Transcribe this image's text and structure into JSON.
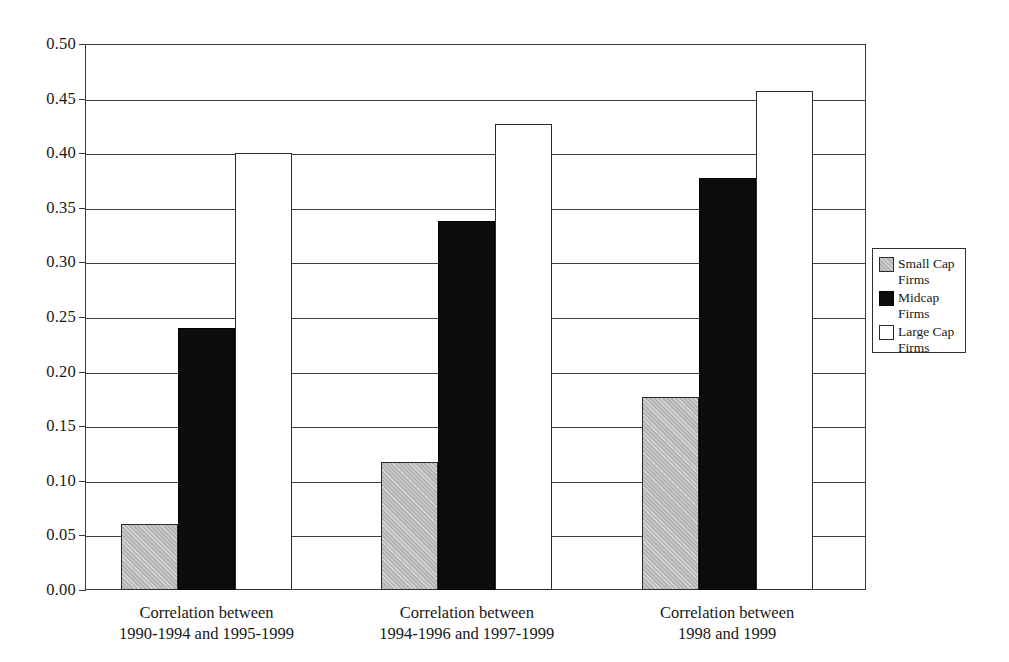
{
  "chart_data": {
    "type": "bar",
    "title": "",
    "subtitle": "",
    "xlabel": "",
    "ylabel": "",
    "ylim": [
      0.0,
      0.5
    ],
    "ytick_labels": [
      "0.50",
      "0.45",
      "0.40",
      "0.35",
      "0.30",
      "0.25",
      "0.20",
      "0.15",
      "0.10",
      "0.05",
      "0.00"
    ],
    "ytick_values": [
      0.5,
      0.45,
      0.4,
      0.35,
      0.3,
      0.25,
      0.2,
      0.15,
      0.1,
      0.05,
      0.0
    ],
    "grid": true,
    "grid_axis": "y",
    "legend_position": "right",
    "categories": [
      "Correlation between\n1990-1994 and 1995-1999",
      "Correlation between\n1994-1996 and 1997-1999",
      "Correlation between\n1998 and 1999"
    ],
    "category_lines": [
      [
        "Correlation between",
        "1990-1994 and 1995-1999"
      ],
      [
        "Correlation between",
        "1994-1996 and 1997-1999"
      ],
      [
        "Correlation between",
        "1998 and 1999"
      ]
    ],
    "series": [
      {
        "name": "Small Cap\nFirms",
        "legend_label": "Small Cap\nFirms",
        "color": "#b4b4b4",
        "values": [
          0.06,
          0.117,
          0.177
        ]
      },
      {
        "name": "Midcap Firms",
        "legend_label": "Midcap Firms",
        "color": "#0d0d0d",
        "values": [
          0.24,
          0.338,
          0.377
        ]
      },
      {
        "name": "Large Cap\nFirms",
        "legend_label": "Large Cap\nFirms",
        "color": "#ffffff",
        "values": [
          0.4,
          0.427,
          0.457
        ]
      }
    ]
  },
  "legend": {
    "items": [
      {
        "label": "Small Cap\nFirms",
        "swatch": "small-cap"
      },
      {
        "label": "Midcap Firms",
        "swatch": "midcap"
      },
      {
        "label": "Large Cap\nFirms",
        "swatch": "large-cap"
      }
    ]
  }
}
